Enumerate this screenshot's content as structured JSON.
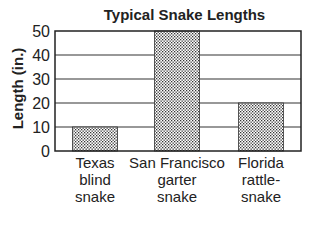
{
  "chart_data": {
    "type": "bar",
    "title": "Typical Snake Lengths",
    "xlabel": "",
    "ylabel": "Length (in.)",
    "categories": [
      "Texas blind snake",
      "San Francisco garter snake",
      "Florida rattle-snake"
    ],
    "category_lines": [
      [
        "Texas",
        "blind",
        "snake"
      ],
      [
        "San Francisco",
        "garter",
        "snake"
      ],
      [
        "Florida",
        "rattle-",
        "snake"
      ]
    ],
    "values": [
      10,
      50,
      20
    ],
    "ylim": [
      0,
      50
    ],
    "yticks": [
      "50",
      "40",
      "30",
      "20",
      "10",
      "0"
    ],
    "grid": true,
    "legend": null,
    "bar_fill": "dotted stipple pattern"
  }
}
